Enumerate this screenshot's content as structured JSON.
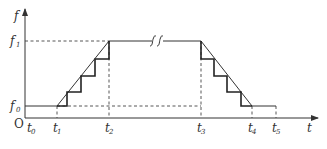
{
  "diagram": {
    "type": "frequency-time staircase ramp profile",
    "axes": {
      "y_label": "f",
      "x_label": "t",
      "origin_label": "O"
    },
    "y_levels": [
      {
        "name": "f",
        "sub": "1",
        "role": "high frequency"
      },
      {
        "name": "f",
        "sub": "0",
        "role": "start frequency"
      }
    ],
    "x_marks": [
      {
        "name": "t",
        "sub": "0"
      },
      {
        "name": "t",
        "sub": "1"
      },
      {
        "name": "t",
        "sub": "2"
      },
      {
        "name": "t",
        "sub": "3"
      },
      {
        "name": "t",
        "sub": "4"
      },
      {
        "name": "t",
        "sub": "5"
      }
    ],
    "segments": {
      "accel_steps": 4,
      "decel_steps": 4,
      "break_mark": "axis break on constant f1 segment"
    },
    "colors": {
      "line": "#333333",
      "dashed": "#444444",
      "text": "#333333"
    }
  }
}
